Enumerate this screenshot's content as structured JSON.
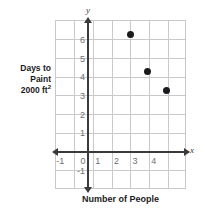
{
  "chart_data": {
    "type": "scatter",
    "title": "",
    "xlabel": "Number of People",
    "ylabel": "Days to Paint 2000 ft",
    "ylabel_sup": "2",
    "axis_letter_x": "x",
    "axis_letter_y": "y",
    "xlim": [
      -1.7,
      5.3
    ],
    "ylim": [
      -1.9,
      7.1
    ],
    "grid": true,
    "legend": "none",
    "x_ticks": [
      {
        "value": -1,
        "label": "-1"
      },
      {
        "value": 0,
        "label": "0"
      },
      {
        "value": 1,
        "label": "1"
      },
      {
        "value": 2,
        "label": "2"
      },
      {
        "value": 3,
        "label": "3"
      },
      {
        "value": 4,
        "label": "4"
      }
    ],
    "y_ticks": [
      {
        "value": -1,
        "label": "-1"
      },
      {
        "value": 1,
        "label": "1"
      },
      {
        "value": 2,
        "label": "2"
      },
      {
        "value": 3,
        "label": "3"
      },
      {
        "value": 4,
        "label": "4"
      },
      {
        "value": 5,
        "label": "5"
      },
      {
        "value": 6,
        "label": "6"
      }
    ],
    "points": [
      {
        "x": 2.25,
        "y": 6.3
      },
      {
        "x": 3.2,
        "y": 4.3
      },
      {
        "x": 4.2,
        "y": 3.3
      }
    ],
    "colors": {
      "point": "#1b1b1d",
      "axis": "#3a3a3c",
      "grid": "#c9c9cc",
      "tick_text": "#6e6e73",
      "title_text": "#1b1b1d",
      "background": "#ffffff"
    }
  }
}
